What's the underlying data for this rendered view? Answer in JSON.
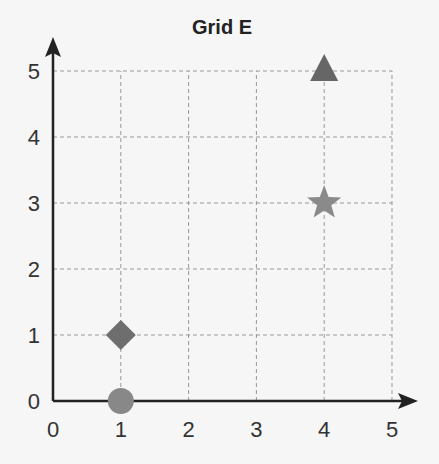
{
  "chart_data": {
    "type": "scatter",
    "title": "Grid E",
    "xlabel": "",
    "ylabel": "",
    "xlim": [
      0,
      5
    ],
    "ylim": [
      0,
      5
    ],
    "x_ticks": [
      "0",
      "1",
      "2",
      "3",
      "4",
      "5"
    ],
    "y_ticks": [
      "0",
      "1",
      "2",
      "3",
      "4",
      "5"
    ],
    "grid": true,
    "grid_style": "dashed",
    "points": [
      {
        "shape": "triangle",
        "x": 4,
        "y": 5,
        "color": "#666666"
      },
      {
        "shape": "star",
        "x": 4,
        "y": 3,
        "color": "#8a8a8a"
      },
      {
        "shape": "diamond",
        "x": 1,
        "y": 1,
        "color": "#6e6e6e"
      },
      {
        "shape": "circle",
        "x": 1,
        "y": 0,
        "color": "#888888"
      }
    ]
  },
  "colors": {
    "axis": "#222222",
    "grid": "#999999",
    "background": "#f6f6f6"
  }
}
